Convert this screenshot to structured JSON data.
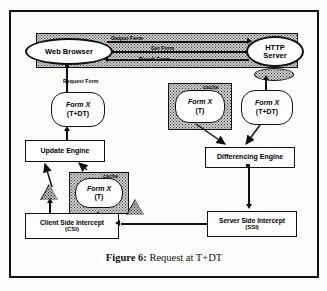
{
  "figure": {
    "caption_number": "Figure 6:",
    "caption_text": "Request at T+DT"
  },
  "nodes": {
    "web_browser": "Web Browser",
    "http_server_line1": "HTTP",
    "http_server_line2": "Server",
    "form_left_line1": "Form X",
    "form_left_line2": "(T+DT)",
    "form_cache_line1": "Form X",
    "form_cache_line2": "(T)",
    "form_right_line1": "Form X",
    "form_right_line2": "(T+DT)",
    "form_csi_line1": "Form X",
    "form_csi_line2": "(T)",
    "update_engine": "Update Engine",
    "differencing_engine": "Differencing Engine",
    "client_side_intercept": "Client Side Intercept",
    "client_side_intercept_abbr": "(CSI)",
    "server_side_intercept": "Server Side Intercept",
    "server_side_intercept_abbr": "(SSI)"
  },
  "labels": {
    "cache_mid": "cache",
    "cache_csi": "cache",
    "edge_output_form": "Output Form",
    "edge_get_form": "Get Form",
    "edge_result_form": "Result Form",
    "edge_request_form": "Request Form"
  },
  "colors": {
    "ink": "#111111",
    "paper": "#fdfdfb",
    "stipple_fill": "#cfcfcf",
    "marker_fill": "#b9b9b9"
  }
}
